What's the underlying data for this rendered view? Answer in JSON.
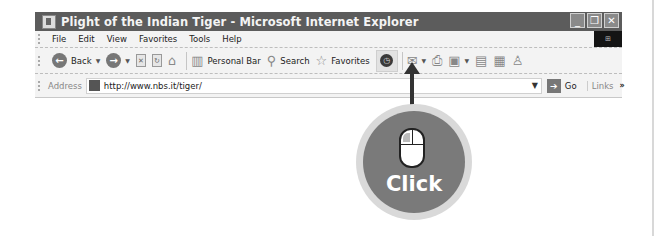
{
  "window": {
    "title": "Plight of the Indian Tiger - Microsoft Internet Explorer",
    "controls": {
      "minimize": "_",
      "restore": "❐",
      "close": "✕"
    }
  },
  "menu": {
    "items": [
      "File",
      "Edit",
      "View",
      "Favorites",
      "Tools",
      "Help"
    ]
  },
  "toolbar": {
    "back_label": "Back",
    "personal_bar_label": "Personal Bar",
    "search_label": "Search",
    "favorites_label": "Favorites"
  },
  "address": {
    "label": "Address",
    "value": "http://www.nbs.it/tiger/",
    "go_label": "Go",
    "links_label": "Links",
    "more": "»"
  },
  "callout": {
    "action": "Click",
    "target": "history-button",
    "color": "#7a7a7a"
  }
}
